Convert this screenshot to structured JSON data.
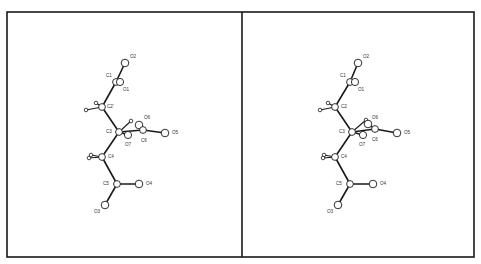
{
  "figure": {
    "type": "stereo-pair molecular structure (ball-and-stick)",
    "frame": {
      "x": 7,
      "y": 12,
      "width": 467,
      "height": 245,
      "divider_x": 242
    },
    "colors": {
      "line": "#1a1a1a",
      "background": "#ffffff",
      "label": "#333333"
    },
    "panels": [
      {
        "name": "left",
        "atoms": [
          {
            "id": "O2",
            "label": "O2",
            "x": 125,
            "y": 63,
            "r": 3.8,
            "lx": 130,
            "ly": 58
          },
          {
            "id": "C1",
            "label": "C1",
            "x": 116,
            "y": 82,
            "r": 3.4,
            "lx": 106,
            "ly": 77
          },
          {
            "id": "O1",
            "label": "O1",
            "x": 120,
            "y": 82,
            "r": 3.6,
            "lx": 123,
            "ly": 91
          },
          {
            "id": "C2",
            "label": "C2'",
            "x": 102,
            "y": 107,
            "r": 3.4,
            "lx": 107,
            "ly": 108
          },
          {
            "id": "C3",
            "label": "C3",
            "x": 119,
            "y": 132,
            "r": 3.4,
            "lx": 106,
            "ly": 133
          },
          {
            "id": "O7",
            "label": "O7",
            "x": 128,
            "y": 135,
            "r": 3.6,
            "lx": 125,
            "ly": 146
          },
          {
            "id": "O6",
            "label": "O6",
            "x": 139,
            "y": 125,
            "r": 3.8,
            "lx": 144,
            "ly": 119
          },
          {
            "id": "C6",
            "label": "C6",
            "x": 143,
            "y": 130,
            "r": 3.4,
            "lx": 141,
            "ly": 142
          },
          {
            "id": "O5",
            "label": "O5",
            "x": 165,
            "y": 133,
            "r": 3.8,
            "lx": 172,
            "ly": 134
          },
          {
            "id": "C4",
            "label": "C4",
            "x": 102,
            "y": 157,
            "r": 3.4,
            "lx": 108,
            "ly": 158
          },
          {
            "id": "C5",
            "label": "C5",
            "x": 117,
            "y": 184,
            "r": 3.4,
            "lx": 103,
            "ly": 185
          },
          {
            "id": "O4",
            "label": "O4",
            "x": 139,
            "y": 184,
            "r": 3.8,
            "lx": 146,
            "ly": 185
          },
          {
            "id": "O3",
            "label": "O3",
            "x": 105,
            "y": 205,
            "r": 3.8,
            "lx": 94,
            "ly": 213
          }
        ],
        "hydrogens": [
          {
            "x": 96,
            "y": 103,
            "r": 1.8
          },
          {
            "x": 86,
            "y": 110,
            "r": 1.8
          },
          {
            "x": 131,
            "y": 121,
            "r": 1.8
          },
          {
            "x": 91,
            "y": 155,
            "r": 1.8
          },
          {
            "x": 89,
            "y": 158,
            "r": 1.8
          }
        ]
      },
      {
        "name": "right",
        "atoms": [
          {
            "id": "O2",
            "label": "O2",
            "x": 358,
            "y": 63,
            "r": 3.8,
            "lx": 363,
            "ly": 58
          },
          {
            "id": "C1",
            "label": "C1",
            "x": 350,
            "y": 82,
            "r": 3.4,
            "lx": 340,
            "ly": 77
          },
          {
            "id": "O1",
            "label": "O1",
            "x": 355,
            "y": 82,
            "r": 3.6,
            "lx": 358,
            "ly": 91
          },
          {
            "id": "C2",
            "label": "C2",
            "x": 335,
            "y": 107,
            "r": 3.4,
            "lx": 341,
            "ly": 108
          },
          {
            "id": "C3",
            "label": "C3",
            "x": 352,
            "y": 132,
            "r": 3.4,
            "lx": 339,
            "ly": 133
          },
          {
            "id": "O7",
            "label": "O7",
            "x": 363,
            "y": 135,
            "r": 3.6,
            "lx": 359,
            "ly": 146
          },
          {
            "id": "O6",
            "label": "O6",
            "x": 368,
            "y": 124,
            "r": 3.8,
            "lx": 372,
            "ly": 119
          },
          {
            "id": "C6",
            "label": "C6",
            "x": 375,
            "y": 129,
            "r": 3.4,
            "lx": 372,
            "ly": 141
          },
          {
            "id": "O5",
            "label": "O5",
            "x": 397,
            "y": 133,
            "r": 3.8,
            "lx": 404,
            "ly": 134
          },
          {
            "id": "C4",
            "label": "C4",
            "x": 335,
            "y": 157,
            "r": 3.4,
            "lx": 341,
            "ly": 158
          },
          {
            "id": "C5",
            "label": "C5",
            "x": 350,
            "y": 184,
            "r": 3.4,
            "lx": 336,
            "ly": 185
          },
          {
            "id": "O4",
            "label": "O4",
            "x": 373,
            "y": 184,
            "r": 3.8,
            "lx": 380,
            "ly": 185
          },
          {
            "id": "O3",
            "label": "O3",
            "x": 338,
            "y": 205,
            "r": 3.8,
            "lx": 327,
            "ly": 213
          }
        ],
        "hydrogens": [
          {
            "x": 328,
            "y": 103,
            "r": 1.8
          },
          {
            "x": 320,
            "y": 110,
            "r": 1.8
          },
          {
            "x": 366,
            "y": 120,
            "r": 1.8
          },
          {
            "x": 324,
            "y": 155,
            "r": 1.8
          },
          {
            "x": 323,
            "y": 158,
            "r": 1.8
          }
        ]
      }
    ],
    "bonds": [
      [
        "O2",
        "C1"
      ],
      [
        "C1",
        "O1"
      ],
      [
        "C1",
        "C2"
      ],
      [
        "C2",
        "C3"
      ],
      [
        "C3",
        "O7"
      ],
      [
        "C3",
        "C6"
      ],
      [
        "C6",
        "O6"
      ],
      [
        "C6",
        "O5"
      ],
      [
        "C3",
        "C4"
      ],
      [
        "C4",
        "C5"
      ],
      [
        "C5",
        "O4"
      ],
      [
        "C5",
        "O3"
      ]
    ],
    "h_bonds": [
      {
        "from": "C2",
        "h": 0
      },
      {
        "from": "C2",
        "h": 1
      },
      {
        "from": "C3",
        "h": 2
      },
      {
        "from": "C4",
        "h": 3
      },
      {
        "from": "C4",
        "h": 4
      }
    ]
  }
}
